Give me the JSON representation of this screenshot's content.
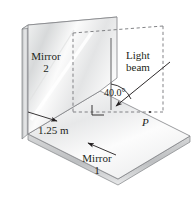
{
  "figure": {
    "type": "physics-optics-diagram",
    "labels": {
      "mirror2_line1": "Mirror",
      "mirror2_line2": "2",
      "mirror1_line1": "Mirror",
      "mirror1_line2": "1",
      "light_beam_line1": "Light",
      "light_beam_line2": "beam",
      "angle": "40.0°",
      "distance": "1.25 m",
      "point_p": "P"
    },
    "colors": {
      "ink": "#231f20",
      "outline": "#6d6e71",
      "mirror_face_light": "#ffffff",
      "mirror_face_shade": "#d9dadb",
      "edge_shade": "#bcbec0",
      "dashed": "#808285",
      "background": "#ffffff"
    },
    "geometry": {
      "angle_degrees": 40.0,
      "distance_meters": 1.25,
      "mirror_angle_between_degrees": 90
    }
  }
}
